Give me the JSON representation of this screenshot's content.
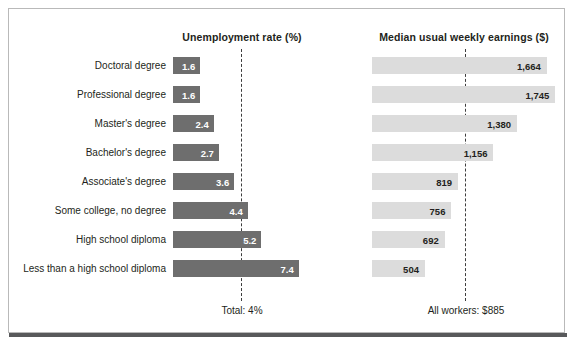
{
  "headers": {
    "unemployment": "Unemployment rate (%)",
    "earnings": "Median usual weekly earnings ($)"
  },
  "notes": {
    "total": "Total: 4%",
    "all_workers": "All workers: $885"
  },
  "colors": {
    "unemployment_bar": "#6e6e6e",
    "earnings_bar": "#dcdcdc",
    "text": "#231f20",
    "reference_line": "#3d3d3d",
    "frame_border": "#b9b9b9",
    "frame_shadow": "#58595b"
  },
  "chart_data": {
    "type": "bar",
    "title": "",
    "orientation": "horizontal",
    "grid": false,
    "legend": null,
    "categories": [
      "Doctoral degree",
      "Professional degree",
      "Master's degree",
      "Bachelor's degree",
      "Associate's degree",
      "Some college, no degree",
      "High school diploma",
      "Less than a high school diploma"
    ],
    "panels": [
      {
        "name": "unemployment",
        "title": "Unemployment rate (%)",
        "xlabel": "",
        "ylabel": "",
        "xlim": [
          0,
          8.2
        ],
        "values": [
          1.6,
          1.6,
          2.4,
          2.7,
          3.6,
          4.4,
          5.2,
          7.4
        ],
        "value_labels": [
          "1.6",
          "1.6",
          "2.4",
          "2.7",
          "3.6",
          "4.4",
          "5.2",
          "7.4"
        ],
        "reference": {
          "value": 4,
          "label": "Total: 4%"
        }
      },
      {
        "name": "earnings",
        "title": "Median usual weekly earnings ($)",
        "xlabel": "",
        "ylabel": "",
        "xlim": [
          0,
          1950
        ],
        "values": [
          1664,
          1745,
          1380,
          1156,
          819,
          756,
          692,
          504
        ],
        "value_labels": [
          "1,664",
          "1,745",
          "1,380",
          "1,156",
          "819",
          "756",
          "692",
          "504"
        ],
        "reference": {
          "value": 885,
          "label": "All workers: $885"
        }
      }
    ]
  },
  "rows": [
    {
      "label": "Doctoral degree",
      "unemployment": "1.6",
      "earnings": "1,664"
    },
    {
      "label": "Professional degree",
      "unemployment": "1.6",
      "earnings": "1,745"
    },
    {
      "label": "Master's degree",
      "unemployment": "2.4",
      "earnings": "1,380"
    },
    {
      "label": "Bachelor's degree",
      "unemployment": "2.7",
      "earnings": "1,156"
    },
    {
      "label": "Associate's degree",
      "unemployment": "3.6",
      "earnings": "819"
    },
    {
      "label": "Some college, no degree",
      "unemployment": "4.4",
      "earnings": "756"
    },
    {
      "label": "High school diploma",
      "unemployment": "5.2",
      "earnings": "692"
    },
    {
      "label": "Less than a high school diploma",
      "unemployment": "7.4",
      "earnings": "504"
    }
  ]
}
